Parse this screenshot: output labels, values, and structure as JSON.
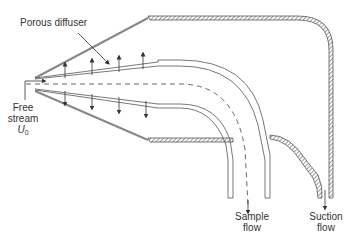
{
  "diagram": {
    "type": "cross-section schematic",
    "labels": {
      "porous_diffuser": "Porous diffuser",
      "free_stream_line1": "Free",
      "free_stream_line2": "stream",
      "free_stream_symbol": "U",
      "free_stream_subscript": "0",
      "sample_flow_line1": "Sample",
      "sample_flow_line2": "flow",
      "suction_flow_line1": "Suction",
      "suction_flow_line2": "flow"
    },
    "colors": {
      "line": "#555555",
      "outer_cone": "#888888",
      "text": "#333333",
      "background": "#ffffff"
    }
  }
}
